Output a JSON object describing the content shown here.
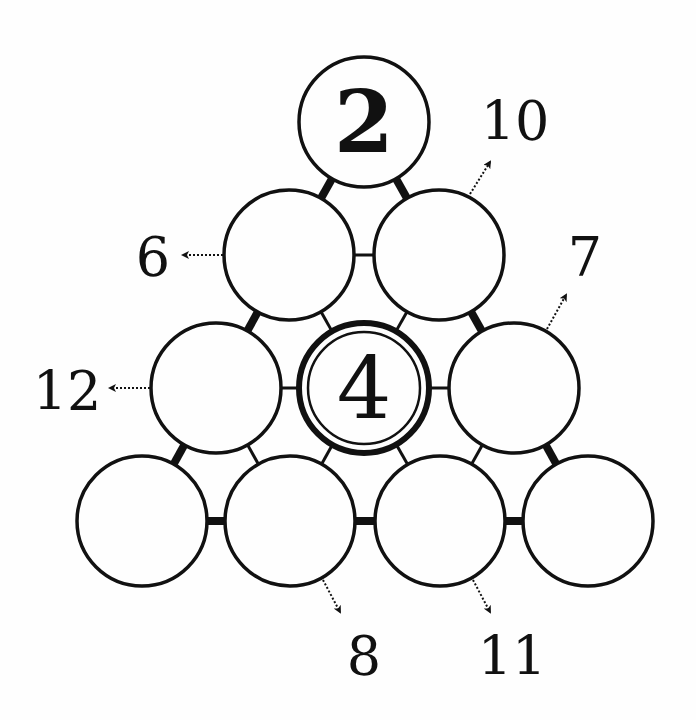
{
  "puzzle": {
    "type": "number-pyramid",
    "radius": 66,
    "colors": {
      "ink": "#111111",
      "background": "#fefefe"
    },
    "circles": [
      {
        "id": "r1c1",
        "cx": 364,
        "cy": 122,
        "value": "2",
        "given": true,
        "double_ring": false
      },
      {
        "id": "r2c1",
        "cx": 289,
        "cy": 255,
        "value": "",
        "given": false,
        "double_ring": false
      },
      {
        "id": "r2c2",
        "cx": 439,
        "cy": 255,
        "value": "",
        "given": false,
        "double_ring": false
      },
      {
        "id": "r3c1",
        "cx": 216,
        "cy": 388,
        "value": "",
        "given": false,
        "double_ring": false
      },
      {
        "id": "r3c2",
        "cx": 364,
        "cy": 388,
        "value": "4",
        "given": true,
        "double_ring": true
      },
      {
        "id": "r3c3",
        "cx": 514,
        "cy": 388,
        "value": "",
        "given": false,
        "double_ring": false
      },
      {
        "id": "r4c1",
        "cx": 142,
        "cy": 521,
        "value": "",
        "given": false,
        "double_ring": false
      },
      {
        "id": "r4c2",
        "cx": 290,
        "cy": 521,
        "value": "",
        "given": false,
        "double_ring": false
      },
      {
        "id": "r4c3",
        "cx": 440,
        "cy": 521,
        "value": "",
        "given": false,
        "double_ring": false
      },
      {
        "id": "r4c4",
        "cx": 588,
        "cy": 521,
        "value": "",
        "given": false,
        "double_ring": false
      }
    ],
    "connectors": [
      {
        "from": "r1c1",
        "to": "r2c1",
        "style": "thick"
      },
      {
        "from": "r1c1",
        "to": "r2c2",
        "style": "thick"
      },
      {
        "from": "r2c1",
        "to": "r2c2",
        "style": "thin"
      },
      {
        "from": "r2c1",
        "to": "r3c1",
        "style": "thick"
      },
      {
        "from": "r2c1",
        "to": "r3c2",
        "style": "thin"
      },
      {
        "from": "r2c2",
        "to": "r3c2",
        "style": "thin"
      },
      {
        "from": "r2c2",
        "to": "r3c3",
        "style": "thick"
      },
      {
        "from": "r3c1",
        "to": "r3c2",
        "style": "thin"
      },
      {
        "from": "r3c2",
        "to": "r3c3",
        "style": "thin"
      },
      {
        "from": "r3c1",
        "to": "r4c1",
        "style": "thick"
      },
      {
        "from": "r3c1",
        "to": "r4c2",
        "style": "thin"
      },
      {
        "from": "r3c2",
        "to": "r4c2",
        "style": "thin"
      },
      {
        "from": "r3c2",
        "to": "r4c3",
        "style": "thin"
      },
      {
        "from": "r3c3",
        "to": "r4c3",
        "style": "thin"
      },
      {
        "from": "r3c3",
        "to": "r4c4",
        "style": "thick"
      },
      {
        "from": "r4c1",
        "to": "r4c2",
        "style": "thick"
      },
      {
        "from": "r4c2",
        "to": "r4c3",
        "style": "thick"
      },
      {
        "from": "r4c3",
        "to": "r4c4",
        "style": "thick"
      }
    ],
    "clues": [
      {
        "value": "10",
        "target": "r2c2",
        "x1": 470,
        "y1": 194,
        "x2": 490,
        "y2": 162,
        "label_x": 515,
        "label_y": 140
      },
      {
        "value": "6",
        "target": "r2c1",
        "x1": 223,
        "y1": 255,
        "x2": 183,
        "y2": 255,
        "label_x": 153,
        "label_y": 276
      },
      {
        "value": "7",
        "target": "r3c3",
        "x1": 547,
        "y1": 329,
        "x2": 566,
        "y2": 295,
        "label_x": 585,
        "label_y": 276
      },
      {
        "value": "12",
        "target": "r3c1",
        "x1": 150,
        "y1": 388,
        "x2": 110,
        "y2": 388,
        "label_x": 67,
        "label_y": 410
      },
      {
        "value": "8",
        "target": "r4c2",
        "x1": 323,
        "y1": 580,
        "x2": 340,
        "y2": 612,
        "label_x": 364,
        "label_y": 675
      },
      {
        "value": "11",
        "target": "r4c3",
        "x1": 473,
        "y1": 580,
        "x2": 490,
        "y2": 612,
        "label_x": 512,
        "label_y": 675
      }
    ]
  }
}
